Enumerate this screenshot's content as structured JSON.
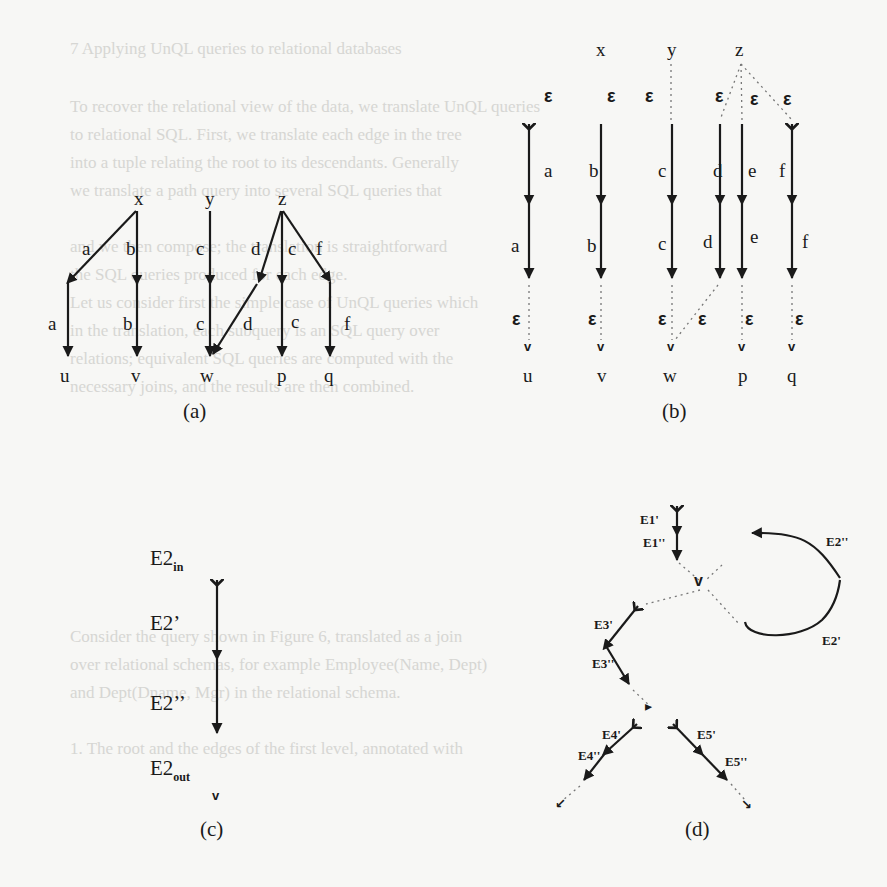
{
  "page": {
    "bleed_through_lines": [
      {
        "y": 52,
        "x": 70,
        "text": "7   Applying UnQL queries to relational databases"
      },
      {
        "y": 110,
        "x": 70,
        "text": "To recover the relational view of the data, we translate UnQL queries"
      },
      {
        "y": 138,
        "x": 70,
        "text": "to relational SQL. First, we translate each edge in the tree"
      },
      {
        "y": 166,
        "x": 70,
        "text": "into a tuple relating the root to its descendants. Generally"
      },
      {
        "y": 194,
        "x": 70,
        "text": "we translate a path query into several SQL queries that"
      },
      {
        "y": 250,
        "x": 70,
        "text": "and we then compose; the translation is straightforward"
      },
      {
        "y": 278,
        "x": 70,
        "text": "the SQL queries produced for each edge."
      },
      {
        "y": 306,
        "x": 70,
        "text": "Let us consider first the simple case of UnQL queries which"
      },
      {
        "y": 334,
        "x": 70,
        "text": "in the translation, each subquery is an SQL query over"
      },
      {
        "y": 362,
        "x": 70,
        "text": "relations; equivalent SQL queries are computed with the"
      },
      {
        "y": 390,
        "x": 70,
        "text": "necessary joins, and the results are then combined."
      },
      {
        "y": 640,
        "x": 70,
        "text": "Consider the query shown in Figure 6, translated as a join"
      },
      {
        "y": 668,
        "x": 70,
        "text": "over relational schemas, for example Employee(Name, Dept)"
      },
      {
        "y": 696,
        "x": 70,
        "text": "and Dept(Dname, Mgr) in the relational schema."
      },
      {
        "y": 752,
        "x": 70,
        "text": "1. The root and the edges of the first level, annotated with"
      }
    ]
  },
  "figure": {
    "panel_a": {
      "caption": "(a)",
      "sources": [
        "x",
        "y",
        "z"
      ],
      "targets": [
        "u",
        "v",
        "w",
        "p",
        "q"
      ],
      "edge_labels": {
        "x_u_upper": "a",
        "x_u_lower": "a",
        "x_v_upper": "b",
        "x_v_lower": "b",
        "y_w_upper": "c",
        "y_w_lower": "c",
        "z_w_upper": "d",
        "z_w_lower": "d",
        "z_p_upper": "c",
        "z_p_lower": "c",
        "z_q_upper": "f",
        "z_q_lower": "f"
      }
    },
    "panel_b": {
      "caption": "(b)",
      "sources": [
        "x",
        "y",
        "z"
      ],
      "targets": [
        "u",
        "v",
        "w",
        "p",
        "q"
      ],
      "epsilon": "ε",
      "upper_labels": [
        "a",
        "b",
        "c",
        "d",
        "e",
        "f"
      ],
      "lower_labels": [
        "a",
        "b",
        "c",
        "d",
        "e",
        "f"
      ]
    },
    "panel_c": {
      "caption": "(c)",
      "nodes": {
        "in_base": "E2",
        "in_sub": "in",
        "prime": "E2’",
        "dprime": "E2’’",
        "out_base": "E2",
        "out_sub": "out"
      }
    },
    "panel_d": {
      "caption": "(d)",
      "labels": {
        "e1p": "E1'",
        "e1pp": "E1''",
        "e2pp": "E2''",
        "e2p": "E2'",
        "e3p": "E3'",
        "e3pp": "E3''",
        "e4p": "E4'",
        "e4pp": "E4''",
        "e5p": "E5'",
        "e5pp": "E5''"
      }
    }
  }
}
